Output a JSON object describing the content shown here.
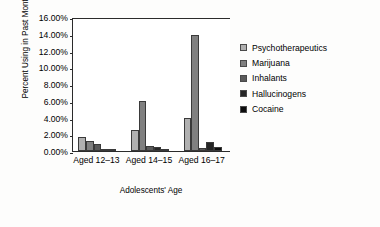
{
  "chart_data": {
    "type": "bar",
    "title": "",
    "xlabel": "Adolescents' Age",
    "ylabel": "Percent Using in Past Month",
    "categories": [
      "Aged 12–13",
      "Aged 14–15",
      "Aged 16–17"
    ],
    "ylim": [
      0,
      16
    ],
    "ytick_labels": [
      "16.00%",
      "14.00%",
      "12.00%",
      "10.00%",
      "8.00%",
      "6.00%",
      "4.00%",
      "2.00%",
      "0.00%"
    ],
    "ytick_values": [
      16,
      14,
      12,
      10,
      8,
      6,
      4,
      2,
      0
    ],
    "grid": false,
    "legend_position": "right",
    "series": [
      {
        "name": "Psychotherapeutics",
        "color": "#b0b0b0",
        "values": [
          1.7,
          2.5,
          3.9
        ]
      },
      {
        "name": "Marijuana",
        "color": "#808080",
        "values": [
          1.2,
          6.0,
          13.9
        ]
      },
      {
        "name": "Inhalants",
        "color": "#5a5a5a",
        "values": [
          0.85,
          0.65,
          0.35
        ]
      },
      {
        "name": "Hallucinogens",
        "color": "#262626",
        "values": [
          0.2,
          0.45,
          1.1
        ]
      },
      {
        "name": "Cocaine",
        "color": "#0d0d0d",
        "values": [
          0.05,
          0.15,
          0.5
        ]
      }
    ]
  }
}
